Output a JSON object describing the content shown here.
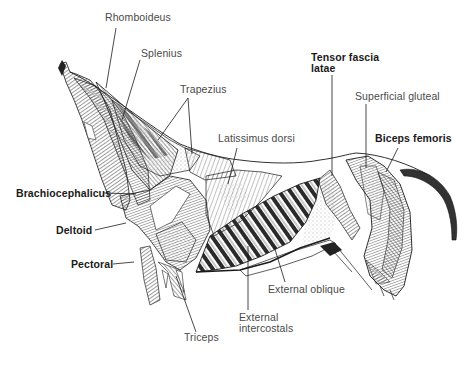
{
  "diagram": {
    "type": "anatomical-illustration",
    "labels": [
      {
        "id": "rhomboideus",
        "text": "Rhomboideus",
        "weight": "normal"
      },
      {
        "id": "splenius",
        "text": "Splenius",
        "weight": "normal"
      },
      {
        "id": "trapezius",
        "text": "Trapezius",
        "weight": "normal"
      },
      {
        "id": "latissimus-dorsi",
        "text": "Latissimus dorsi",
        "weight": "normal"
      },
      {
        "id": "tensor-fascia-latae",
        "text": "Tensor fascia latae",
        "line1": "Tensor fascia",
        "line2": "latae",
        "weight": "bold"
      },
      {
        "id": "superficial-gluteal",
        "text": "Superficial gluteal",
        "weight": "normal"
      },
      {
        "id": "biceps-femoris",
        "text": "Biceps femoris",
        "weight": "bold"
      },
      {
        "id": "brachiocephalicus",
        "text": "Brachiocephalicus",
        "weight": "bold"
      },
      {
        "id": "deltoid",
        "text": "Deltoid",
        "weight": "bold"
      },
      {
        "id": "pectoral",
        "text": "Pectoral",
        "weight": "bold"
      },
      {
        "id": "triceps",
        "text": "Triceps",
        "weight": "normal"
      },
      {
        "id": "external-intercostals",
        "text": "External intercostals",
        "line1": "External",
        "line2": "intercostals",
        "weight": "normal"
      },
      {
        "id": "external-oblique",
        "text": "External oblique",
        "weight": "normal"
      }
    ]
  },
  "colors": {
    "ink": "#1a1a1a",
    "label_text": "#333333",
    "background": "#ffffff"
  }
}
